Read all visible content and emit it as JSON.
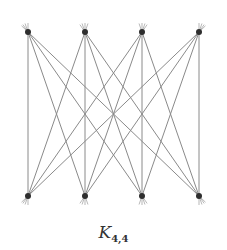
{
  "diagram": {
    "title_main": "K",
    "title_sub": "4,4",
    "edge_color": "#8a8a8a",
    "vertex_color": "#2e2e2e",
    "top_vertices": [
      {
        "id": "u1",
        "x": 28,
        "y": 32
      },
      {
        "id": "u2",
        "x": 85,
        "y": 32
      },
      {
        "id": "u3",
        "x": 142,
        "y": 32
      },
      {
        "id": "u4",
        "x": 199,
        "y": 32
      }
    ],
    "bottom_vertices": [
      {
        "id": "v1",
        "x": 28,
        "y": 196
      },
      {
        "id": "v2",
        "x": 85,
        "y": 196
      },
      {
        "id": "v3",
        "x": 142,
        "y": 196
      },
      {
        "id": "v4",
        "x": 199,
        "y": 196
      }
    ],
    "edges": "complete bipartite: every top vertex joined to every bottom vertex (16 edges)"
  }
}
